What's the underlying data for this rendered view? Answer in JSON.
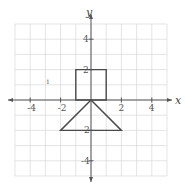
{
  "graph": {
    "x_axis_label": "x",
    "y_axis_label": "y",
    "x_range": [
      -5,
      5
    ],
    "y_range": [
      -5,
      5
    ],
    "grid_step": 1,
    "x_tick_labels": [
      "-4",
      "-2",
      "2",
      "4"
    ],
    "y_tick_labels": [
      "4",
      "2",
      "-2",
      "-4"
    ],
    "stray_mark": "1",
    "colors": {
      "grid": "#d9d9d9",
      "axis": "#555555",
      "shape_stroke": "#4a4a4a"
    }
  },
  "chart_data": {
    "type": "diagram",
    "title": "",
    "xlabel": "x",
    "ylabel": "y",
    "xlim": [
      -5,
      5
    ],
    "ylim": [
      -5,
      5
    ],
    "grid": true,
    "shapes": [
      {
        "name": "square",
        "vertices": [
          [
            -1,
            0
          ],
          [
            1,
            0
          ],
          [
            1,
            2
          ],
          [
            -1,
            2
          ]
        ]
      },
      {
        "name": "triangle",
        "vertices": [
          [
            0,
            0
          ],
          [
            -2,
            -2
          ],
          [
            2,
            -2
          ]
        ]
      }
    ]
  }
}
